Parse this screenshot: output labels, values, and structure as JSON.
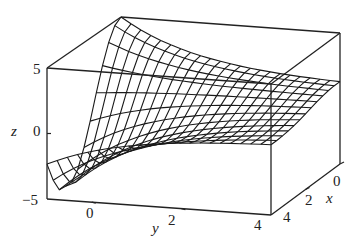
{
  "chart_data": {
    "type": "surface3d",
    "title": "",
    "axes": {
      "x": {
        "label": "x",
        "ticks": [
          "0",
          "2",
          "4"
        ],
        "range": [
          0,
          4
        ]
      },
      "y": {
        "label": "y",
        "ticks": [
          "0",
          "2",
          "4"
        ],
        "range": [
          -1,
          4
        ]
      },
      "z": {
        "label": "z",
        "ticks": [
          "5",
          "0",
          "-5"
        ],
        "range": [
          -5,
          5
        ]
      }
    },
    "style": {
      "mesh": "wireframe",
      "line_color": "#1a1a1a",
      "box": true,
      "grid": false
    }
  },
  "labels": {
    "z_axis": "z",
    "y_axis": "y",
    "x_axis": "x",
    "z_ticks": [
      "5",
      "0",
      "−5"
    ],
    "y_ticks": [
      "0",
      "2",
      "4"
    ],
    "x_ticks": [
      "0",
      "2",
      "4"
    ]
  }
}
